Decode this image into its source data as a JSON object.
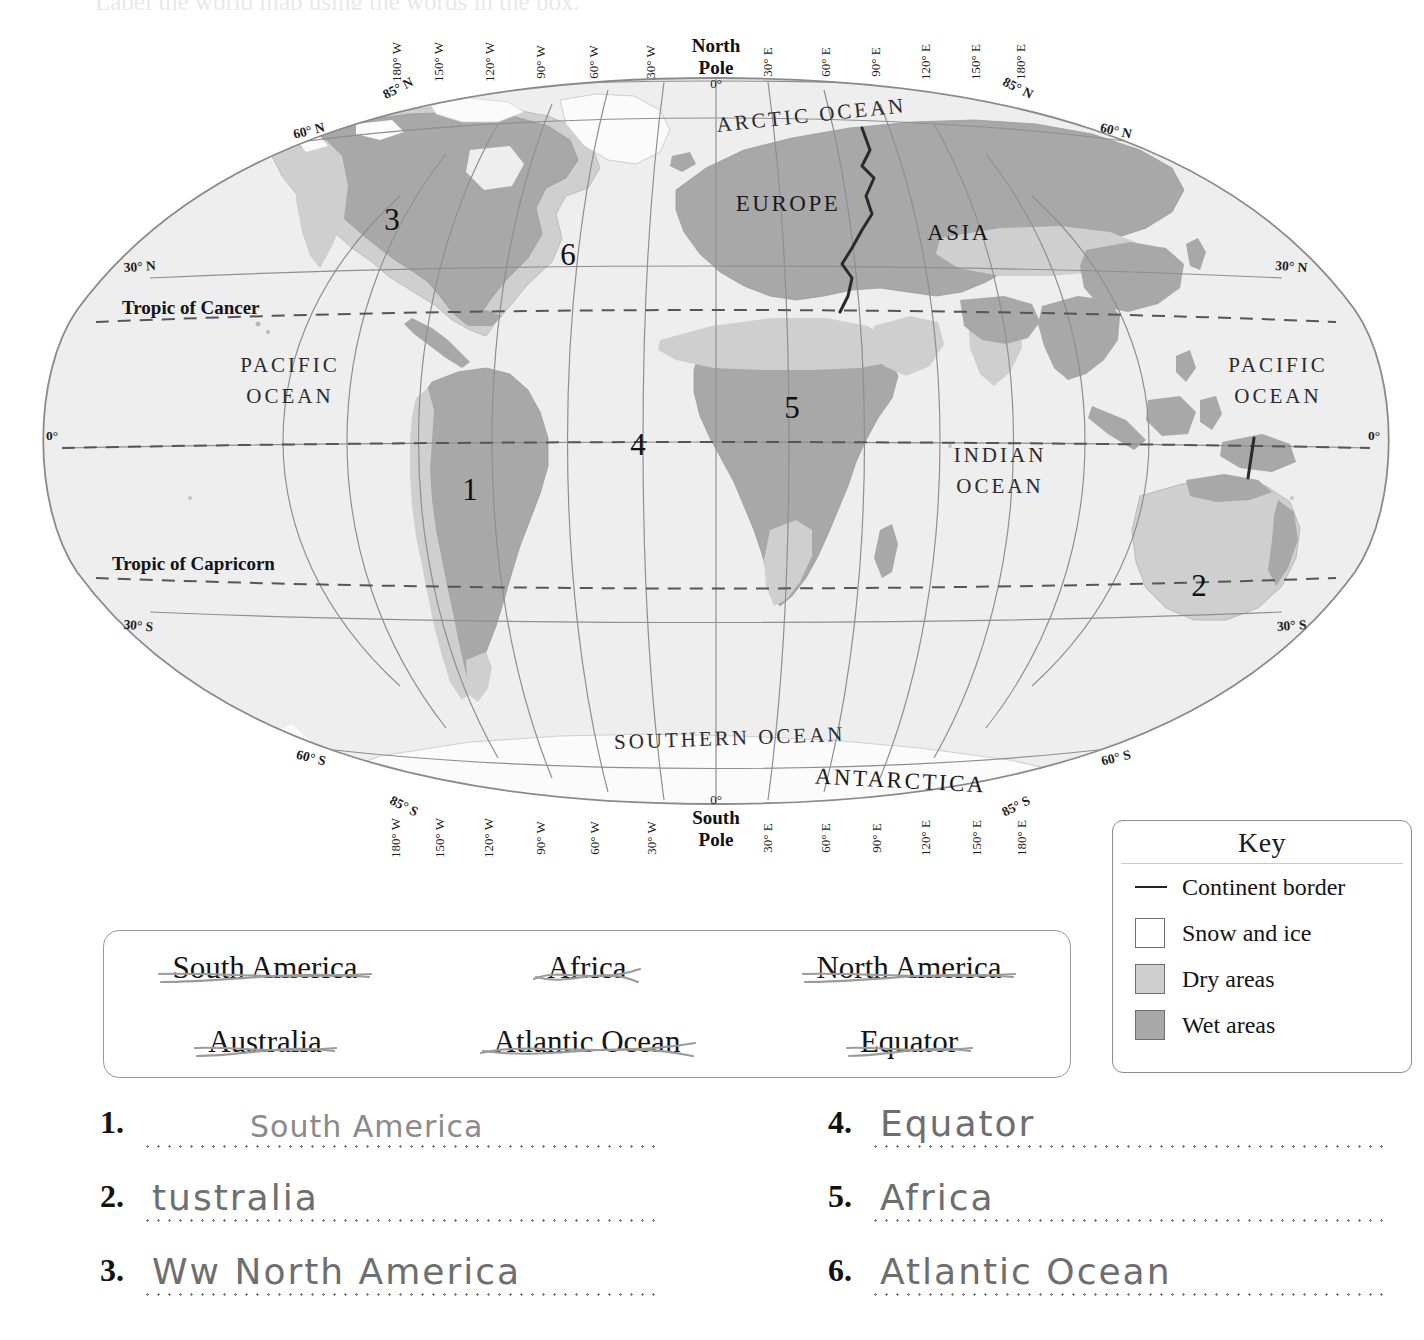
{
  "worksheet": {
    "top_cut_text": "Label the world map using the words in the box.",
    "answers_left": [
      {
        "num": "1.",
        "text": "South America",
        "style": "print"
      },
      {
        "num": "2.",
        "text": "tustralia",
        "style": "pencil"
      },
      {
        "num": "3.",
        "text": "North America",
        "style": "pencil",
        "prefix": "Ww"
      }
    ],
    "answers_right": [
      {
        "num": "4.",
        "text": "Equator",
        "style": "pencil"
      },
      {
        "num": "5.",
        "text": "Africa",
        "style": "pencil"
      },
      {
        "num": "6.",
        "text": "Atlantic Ocean",
        "style": "pencil"
      }
    ]
  },
  "word_bank": {
    "row1": [
      "South America",
      "Africa",
      "North America"
    ],
    "row2": [
      "Australia",
      "Atlantic Ocean",
      "Equator"
    ]
  },
  "key": {
    "title": "Key",
    "items": [
      {
        "label": "Continent border",
        "swatch": "line",
        "color": "#222222"
      },
      {
        "label": "Snow and ice",
        "swatch": "box",
        "color": "#ffffff"
      },
      {
        "label": "Dry areas",
        "swatch": "box",
        "color": "#cfcfcf"
      },
      {
        "label": "Wet areas",
        "swatch": "box",
        "color": "#a8a8a8"
      }
    ]
  },
  "map": {
    "ocean_labels": [
      {
        "name": "ARCTIC OCEAN",
        "x": 812,
        "y": 122,
        "rot": -6,
        "cls": "ocean-label"
      },
      {
        "name": "PACIFIC",
        "x": 290,
        "y": 372,
        "rot": 0,
        "cls": "ocean-label"
      },
      {
        "name": "OCEAN",
        "x": 290,
        "y": 403,
        "rot": 0,
        "cls": "ocean-label"
      },
      {
        "name": "PACIFIC",
        "x": 1278,
        "y": 372,
        "rot": 0,
        "cls": "ocean-label"
      },
      {
        "name": "OCEAN",
        "x": 1278,
        "y": 403,
        "rot": 0,
        "cls": "ocean-label"
      },
      {
        "name": "INDIAN",
        "x": 1000,
        "y": 462,
        "rot": 0,
        "cls": "ocean-label"
      },
      {
        "name": "OCEAN",
        "x": 1000,
        "y": 493,
        "rot": 0,
        "cls": "ocean-label"
      },
      {
        "name": "SOUTHERN  OCEAN",
        "x": 730,
        "y": 745,
        "rot": -2,
        "cls": "ocean-label"
      }
    ],
    "continent_labels": [
      {
        "name": "EUROPE",
        "x": 788,
        "y": 211,
        "rot": 0,
        "cls": "cont-label"
      },
      {
        "name": "ASIA",
        "x": 959,
        "y": 240,
        "rot": 0,
        "cls": "cont-label"
      },
      {
        "name": "ANTARCTICA",
        "x": 900,
        "y": 788,
        "rot": 3,
        "cls": "cont-label"
      }
    ],
    "numbers": [
      {
        "n": "1",
        "x": 470,
        "y": 500
      },
      {
        "n": "2",
        "x": 1199,
        "y": 596
      },
      {
        "n": "3",
        "x": 392,
        "y": 230
      },
      {
        "n": "4",
        "x": 638,
        "y": 455
      },
      {
        "n": "5",
        "x": 792,
        "y": 418
      },
      {
        "n": "6",
        "x": 568,
        "y": 265
      }
    ],
    "tropics": [
      {
        "label": "Tropic of Cancer",
        "x": 122,
        "y": 314
      },
      {
        "label": "Tropic of Capricorn",
        "x": 112,
        "y": 570
      }
    ],
    "poles": [
      {
        "l1": "North",
        "l2": "Pole",
        "x": 716,
        "y": 52
      },
      {
        "l1": "South",
        "l2": "Pole",
        "x": 716,
        "y": 824
      }
    ],
    "lon_top": [
      {
        "t": "180° W",
        "x": 401,
        "y": 62
      },
      {
        "t": "150° W",
        "x": 443,
        "y": 62
      },
      {
        "t": "120° W",
        "x": 494,
        "y": 62
      },
      {
        "t": "90° W",
        "x": 545,
        "y": 62
      },
      {
        "t": "60° W",
        "x": 598,
        "y": 62
      },
      {
        "t": "30° W",
        "x": 655,
        "y": 62
      },
      {
        "t": "0°",
        "x": 716,
        "y": 88
      },
      {
        "t": "30° E",
        "x": 772,
        "y": 62
      },
      {
        "t": "60° E",
        "x": 830,
        "y": 62
      },
      {
        "t": "90° E",
        "x": 880,
        "y": 62
      },
      {
        "t": "120° E",
        "x": 930,
        "y": 62
      },
      {
        "t": "150° E",
        "x": 980,
        "y": 62
      },
      {
        "t": "180° E",
        "x": 1025,
        "y": 62
      }
    ],
    "lon_bottom": [
      {
        "t": "180° W",
        "x": 400,
        "y": 838
      },
      {
        "t": "150° W",
        "x": 444,
        "y": 838
      },
      {
        "t": "120° W",
        "x": 493,
        "y": 838
      },
      {
        "t": "90° W",
        "x": 545,
        "y": 838
      },
      {
        "t": "60° W",
        "x": 599,
        "y": 838
      },
      {
        "t": "30° W",
        "x": 656,
        "y": 838
      },
      {
        "t": "0°",
        "x": 716,
        "y": 804
      },
      {
        "t": "30° E",
        "x": 772,
        "y": 838
      },
      {
        "t": "60° E",
        "x": 830,
        "y": 838
      },
      {
        "t": "90° E",
        "x": 881,
        "y": 838
      },
      {
        "t": "120° E",
        "x": 930,
        "y": 838
      },
      {
        "t": "150° E",
        "x": 981,
        "y": 838
      },
      {
        "t": "180° E",
        "x": 1026,
        "y": 838
      }
    ],
    "lat_labels": [
      {
        "t": "85° N",
        "x": 400,
        "y": 92,
        "rot": -27
      },
      {
        "t": "85° N",
        "x": 1016,
        "y": 92,
        "rot": 27
      },
      {
        "t": "60° N",
        "x": 310,
        "y": 135,
        "rot": -14
      },
      {
        "t": "60° N",
        "x": 1115,
        "y": 135,
        "rot": 13
      },
      {
        "t": "30° N",
        "x": 140,
        "y": 271,
        "rot": -4
      },
      {
        "t": "30° N",
        "x": 1291,
        "y": 271,
        "rot": 4
      },
      {
        "t": "0°",
        "x": 52,
        "y": 440,
        "rot": 0
      },
      {
        "t": "0°",
        "x": 1374,
        "y": 440,
        "rot": 0
      },
      {
        "t": "30° S",
        "x": 138,
        "y": 630,
        "rot": 5
      },
      {
        "t": "30° S",
        "x": 1292,
        "y": 630,
        "rot": -4
      },
      {
        "t": "60° S",
        "x": 310,
        "y": 762,
        "rot": 14
      },
      {
        "t": "60° S",
        "x": 1117,
        "y": 762,
        "rot": -14
      },
      {
        "t": "85° S",
        "x": 402,
        "y": 810,
        "rot": 27
      },
      {
        "t": "85° S",
        "x": 1018,
        "y": 810,
        "rot": -27
      }
    ]
  },
  "colors": {
    "wet": "#a8a8a8",
    "dry": "#cfcfcf",
    "snow": "#fbfbfb",
    "ocean": "#eeeeee",
    "grat": "#8a8a8a",
    "border": "#2a2a2a"
  }
}
